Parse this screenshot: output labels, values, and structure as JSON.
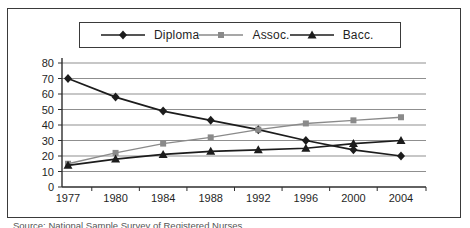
{
  "caption": {
    "text": "Source: National Sample Survey of Registered Nurses."
  },
  "colors": {
    "frame_border": "#3a3a3a",
    "gridline": "#8f8f8f",
    "axis": "#2e2e2e",
    "text": "#1f1f1f",
    "series_black": "#1c1c1c",
    "series_gray": "#8a8a8a"
  },
  "chart_data": {
    "type": "line",
    "title": "",
    "xlabel": "",
    "ylabel": "",
    "categories": [
      "1977",
      "1980",
      "1984",
      "1988",
      "1992",
      "1996",
      "2000",
      "2004"
    ],
    "series": [
      {
        "name": "Diploma",
        "marker": "diamond",
        "color": "#1c1c1c",
        "values": [
          70,
          58,
          49,
          43,
          37,
          30,
          24,
          20
        ]
      },
      {
        "name": "Assoc.",
        "marker": "square",
        "color": "#8a8a8a",
        "values": [
          15,
          22,
          28,
          32,
          37,
          41,
          43,
          45
        ]
      },
      {
        "name": "Bacc.",
        "marker": "triangle",
        "color": "#1c1c1c",
        "values": [
          14,
          18,
          21,
          23,
          24,
          25,
          28,
          30
        ]
      }
    ],
    "ylim": [
      0,
      80
    ],
    "yticks": [
      0,
      10,
      20,
      30,
      40,
      50,
      60,
      70,
      80
    ],
    "grid": true,
    "legend_position": "top"
  }
}
